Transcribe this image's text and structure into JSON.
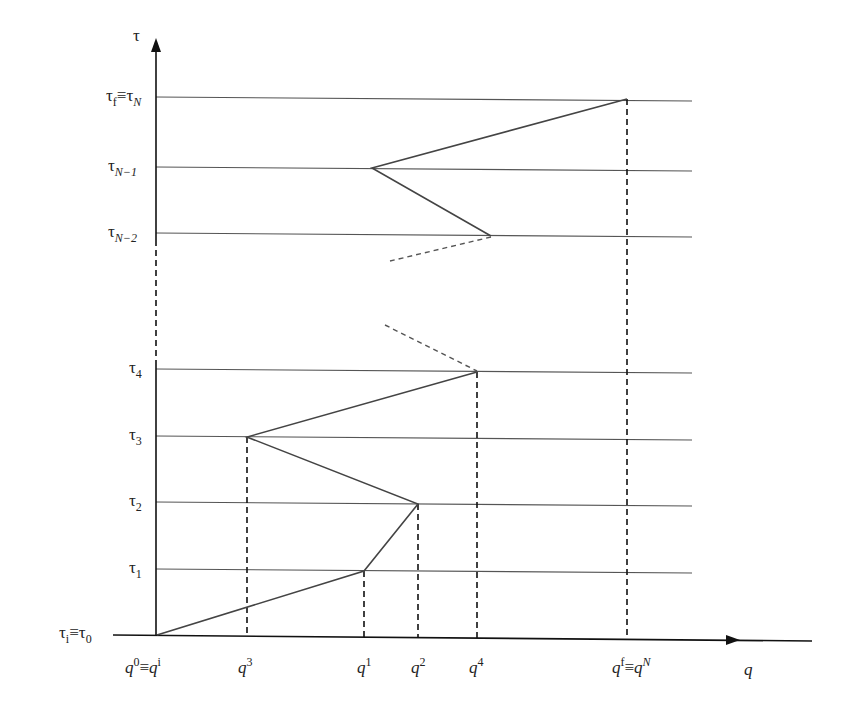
{
  "diagram": {
    "type": "path-discretization",
    "axes": {
      "vertical_label": "τ",
      "horizontal_label": "q"
    },
    "tau_levels": [
      {
        "id": "tau_f",
        "text": "τ",
        "sub": "f",
        "eq": "≡",
        "text2": "τ",
        "sub2": "N",
        "y": 99
      },
      {
        "id": "tau_N-1",
        "text": "τ",
        "sub": "N−1",
        "y": 168
      },
      {
        "id": "tau_N-2",
        "text": "τ",
        "sub": "N−2",
        "y": 234
      },
      {
        "id": "tau_4",
        "text": "τ",
        "sub": "4",
        "y": 370
      },
      {
        "id": "tau_3",
        "text": "τ",
        "sub": "3",
        "y": 437
      },
      {
        "id": "tau_2",
        "text": "τ",
        "sub": "2",
        "y": 503
      },
      {
        "id": "tau_1",
        "text": "τ",
        "sub": "1",
        "y": 570
      }
    ],
    "origin_label": {
      "text": "τ",
      "sub": "i",
      "eq": "≡",
      "text2": "τ",
      "sub2": "0"
    },
    "q_labels": [
      {
        "id": "q0",
        "text": "q",
        "sup": "0",
        "eq": "≡",
        "text2": "q",
        "sup2": "i"
      },
      {
        "id": "q3",
        "text": "q",
        "sup": "3"
      },
      {
        "id": "q1",
        "text": "q",
        "sup": "1"
      },
      {
        "id": "q2",
        "text": "q",
        "sup": "2"
      },
      {
        "id": "q4",
        "text": "q",
        "sup": "4"
      },
      {
        "id": "qf",
        "text": "q",
        "sup": "f",
        "eq": "≡",
        "text2": "q",
        "sup2": "N"
      }
    ],
    "path_points": [
      {
        "label": "q0,τ0",
        "x": 157,
        "y": 635
      },
      {
        "label": "q1,τ1",
        "x": 364,
        "y": 571
      },
      {
        "label": "q2,τ2",
        "x": 418,
        "y": 504
      },
      {
        "label": "q3,τ3",
        "x": 247,
        "y": 437
      },
      {
        "label": "q4,τ4",
        "x": 477,
        "y": 372
      },
      {
        "label": "τN-2",
        "x": 491,
        "y": 236
      },
      {
        "label": "τN-1",
        "x": 372,
        "y": 168
      },
      {
        "label": "qN,τN",
        "x": 627,
        "y": 99
      }
    ]
  }
}
